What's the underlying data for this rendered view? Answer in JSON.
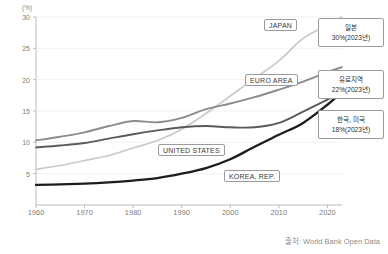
{
  "chart_data": {
    "type": "line",
    "title": "",
    "xlabel": "",
    "ylabel": "(%)",
    "yunit": "(%)",
    "xlim": [
      1960,
      2023
    ],
    "ylim": [
      0,
      30
    ],
    "grid": true,
    "legend_position": "inline-callouts",
    "yticks": [
      5,
      10,
      15,
      20,
      25,
      30
    ],
    "xticks": [
      1960,
      1970,
      1980,
      1990,
      2000,
      2010,
      2020
    ],
    "x": [
      1960,
      1965,
      1970,
      1975,
      1980,
      1985,
      1990,
      1995,
      2000,
      2005,
      2010,
      2015,
      2020,
      2023
    ],
    "series": [
      {
        "name": "JAPAN",
        "color": "#c9c9c9",
        "values": [
          5.7,
          6.3,
          7.1,
          7.9,
          9.1,
          10.3,
          12.1,
          14.6,
          17.4,
          20.2,
          23.0,
          26.6,
          28.7,
          30.0
        ]
      },
      {
        "name": "EURO AREA",
        "color": "#8c8c8c",
        "values": [
          10.3,
          10.9,
          11.6,
          12.6,
          13.4,
          13.2,
          13.9,
          15.3,
          16.2,
          17.2,
          18.4,
          19.7,
          21.2,
          22.0
        ]
      },
      {
        "name": "UNITED STATES",
        "color": "#5a5a5a",
        "values": [
          9.2,
          9.5,
          9.9,
          10.6,
          11.3,
          11.9,
          12.4,
          12.6,
          12.4,
          12.4,
          13.1,
          14.9,
          16.8,
          18.0
        ]
      },
      {
        "name": "KOREA, REP.",
        "color": "#1c1c1c",
        "values": [
          3.2,
          3.3,
          3.4,
          3.6,
          3.9,
          4.3,
          5.0,
          5.9,
          7.3,
          9.3,
          11.2,
          13.1,
          16.0,
          18.0
        ]
      }
    ]
  },
  "axis": {
    "unit_label": "(%)"
  },
  "callouts": [
    {
      "label": "JAPAN"
    },
    {
      "label": "EURO AREA"
    },
    {
      "label": "UNITED STATES"
    },
    {
      "label": "KOREA, REP."
    }
  ],
  "annotations": [
    {
      "region": "일본",
      "value": "30%(2023년)"
    },
    {
      "region": "유로지역",
      "value": "22%(2023년)"
    },
    {
      "region": "한국, 미국",
      "value": "18%(2023년)"
    }
  ],
  "source": {
    "text": "출처: World Bank Open Data"
  }
}
